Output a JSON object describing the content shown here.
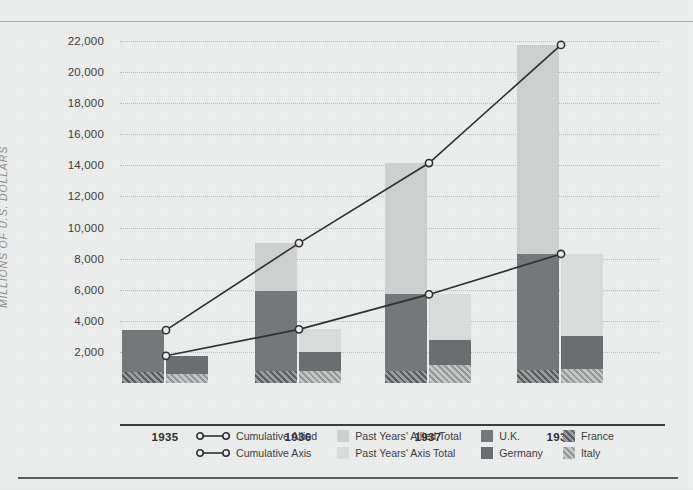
{
  "chart_data": {
    "type": "bar",
    "title": "",
    "xlabel": "",
    "ylabel": "MILLIONS OF U.S. DOLLARS",
    "categories": [
      "1935",
      "1936",
      "1937",
      "1938"
    ],
    "ylim": [
      0,
      22000
    ],
    "ytick_values": [
      2000,
      4000,
      6000,
      8000,
      10000,
      12000,
      14000,
      16000,
      18000,
      20000,
      22000
    ],
    "ytick_labels": [
      "2,000",
      "4,000",
      "6,000",
      "8,000",
      "10,000",
      "12,000",
      "14,000",
      "16,000",
      "18,000",
      "20,000",
      "22,000"
    ],
    "grid": true,
    "legend_position": "bottom",
    "stacked_bars": {
      "allied": {
        "label": "Allied",
        "segments": [
          {
            "name": "France",
            "key": "france",
            "values": [
              700,
              750,
              800,
              850
            ]
          },
          {
            "name": "U.K.",
            "key": "uk",
            "values": [
              2700,
              5150,
              4950,
              7450
            ]
          },
          {
            "name": "Past Years' Allied Total",
            "key": "past_allied",
            "values": [
              0,
              3100,
              8400,
              13450
            ]
          }
        ],
        "totals": [
          3400,
          9000,
          14150,
          21750
        ]
      },
      "axis": {
        "label": "Axis",
        "segments": [
          {
            "name": "Italy",
            "key": "italy",
            "values": [
              600,
              750,
              1150,
              900
            ]
          },
          {
            "name": "Germany",
            "key": "germany",
            "values": [
              1150,
              1250,
              1600,
              2100
            ]
          },
          {
            "name": "Past Years' Axis Total",
            "key": "past_axis",
            "values": [
              0,
              1450,
              2950,
              5300
            ]
          }
        ],
        "totals": [
          1750,
          3450,
          5700,
          8300
        ]
      }
    },
    "series": [
      {
        "name": "Cumulative Allied",
        "type": "line",
        "values": [
          3400,
          9000,
          14150,
          21750
        ]
      },
      {
        "name": "Cumulative Axis",
        "type": "line",
        "values": [
          1750,
          3450,
          5700,
          8300
        ]
      }
    ],
    "colors": {
      "past_allied": "#cfd0d0",
      "past_axis": "#dbdcdc",
      "uk": "#76797b",
      "germany": "#6c6f71",
      "france": "#5a5d5f",
      "italy": "#96999a",
      "line": "#2f3031",
      "background": "#eceded",
      "axis": "#3a3c3d"
    }
  },
  "legend": {
    "items": [
      {
        "label": "Cumulative Allied",
        "swatch": "line-marker",
        "icon": "line-marker-icon"
      },
      {
        "label": "Past Years' Allied Total",
        "swatch": "past_allied",
        "icon": "swatch-icon"
      },
      {
        "label": "U.K.",
        "swatch": "uk",
        "icon": "swatch-icon"
      },
      {
        "label": "France",
        "swatch": "france",
        "icon": "swatch-hatch-icon"
      },
      {
        "label": "Cumulative Axis",
        "swatch": "line-marker",
        "icon": "line-marker-icon"
      },
      {
        "label": "Past Years' Axis Total",
        "swatch": "past_axis",
        "icon": "swatch-icon"
      },
      {
        "label": "Germany",
        "swatch": "germany",
        "icon": "swatch-icon"
      },
      {
        "label": "Italy",
        "swatch": "italy",
        "icon": "swatch-hatch-icon"
      }
    ]
  }
}
